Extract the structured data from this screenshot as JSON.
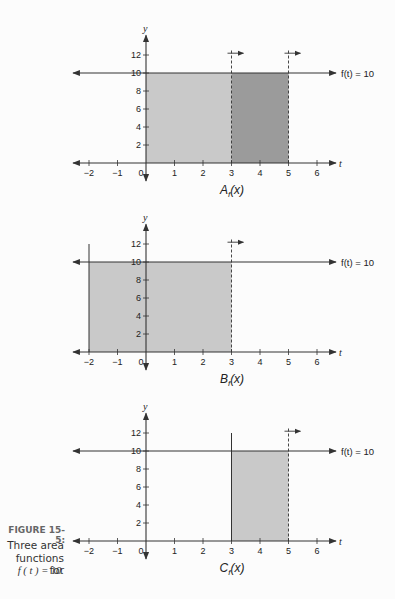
{
  "figure": {
    "label": "FIGURE 15-5:",
    "caption_lines": [
      "Three area",
      "functions for",
      "f ( t ) = 10."
    ]
  },
  "colors": {
    "background": "#fcfcfc",
    "light_fill": "#c9c9c9",
    "dark_fill": "#9b9b9b",
    "axis": "#333333"
  },
  "chart_data": [
    {
      "type": "area",
      "title": "A_f(x)",
      "xlabel": "t",
      "ylabel": "y",
      "function_label": "f(t) = 10",
      "function": "f(t)=10",
      "x_ticks": [
        -2,
        -1,
        0,
        1,
        2,
        3,
        4,
        5,
        6
      ],
      "y_ticks": [
        2,
        4,
        6,
        8,
        10,
        12
      ],
      "xlim": [
        -2.5,
        6.5
      ],
      "ylim": [
        -1,
        13
      ],
      "shaded_regions": [
        {
          "from": 0,
          "to": 3,
          "height": 10,
          "shade": "light"
        },
        {
          "from": 3,
          "to": 5,
          "height": 10,
          "shade": "dark"
        }
      ],
      "left_bound": {
        "x": 0,
        "style": "solid"
      },
      "moving_bounds": [
        {
          "x": 3,
          "style": "dashed",
          "arrow": "right"
        },
        {
          "x": 5,
          "style": "dashed",
          "arrow": "right"
        }
      ]
    },
    {
      "type": "area",
      "title": "B_f(x)",
      "xlabel": "t",
      "ylabel": "y",
      "function_label": "f(t) = 10",
      "function": "f(t)=10",
      "x_ticks": [
        -2,
        -1,
        0,
        1,
        2,
        3,
        4,
        5,
        6
      ],
      "y_ticks": [
        2,
        4,
        6,
        8,
        10,
        12
      ],
      "xlim": [
        -2.5,
        6.5
      ],
      "ylim": [
        -1,
        13
      ],
      "shaded_regions": [
        {
          "from": -2,
          "to": 3,
          "height": 10,
          "shade": "light"
        }
      ],
      "left_bound": {
        "x": -2,
        "style": "solid"
      },
      "moving_bounds": [
        {
          "x": 3,
          "style": "dashed",
          "arrow": "right"
        }
      ]
    },
    {
      "type": "area",
      "title": "C_f(x)",
      "xlabel": "t",
      "ylabel": "y",
      "function_label": "f(t) = 10",
      "function": "f(t)=10",
      "x_ticks": [
        -2,
        -1,
        0,
        1,
        2,
        3,
        4,
        5,
        6
      ],
      "y_ticks": [
        2,
        4,
        6,
        8,
        10,
        12
      ],
      "xlim": [
        -2.5,
        6.5
      ],
      "ylim": [
        -1,
        13
      ],
      "shaded_regions": [
        {
          "from": 3,
          "to": 5,
          "height": 10,
          "shade": "light"
        }
      ],
      "left_bound": {
        "x": 3,
        "style": "solid"
      },
      "moving_bounds": [
        {
          "x": 5,
          "style": "dashed",
          "arrow": "right"
        }
      ]
    }
  ],
  "panels": [
    {
      "title_main": "A",
      "title_sub": "f",
      "title_arg": "(x)"
    },
    {
      "title_main": "B",
      "title_sub": "f",
      "title_arg": "(x)"
    },
    {
      "title_main": "C",
      "title_sub": "f",
      "title_arg": "(x)"
    }
  ]
}
